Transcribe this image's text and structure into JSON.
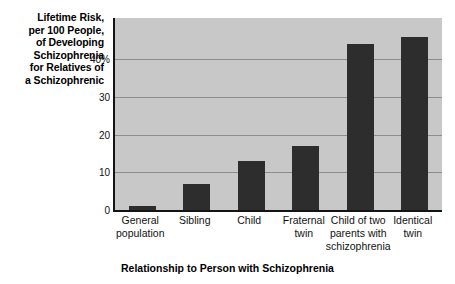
{
  "chart_data": {
    "type": "bar",
    "title": "",
    "ylabel": "Lifetime Risk, per 100 People, of Developing Schizophrenia for Relatives of a Schizophrenic",
    "xlabel": "Relationship to Person with Schizophrenia",
    "categories": [
      "General population",
      "Sibling",
      "Child",
      "Fraternal twin",
      "Child of two parents with schizophrenia",
      "Identical twin"
    ],
    "values": [
      1,
      7,
      13,
      17,
      44,
      46
    ],
    "ylim": [
      0,
      51
    ],
    "yticks": [
      0,
      10,
      20,
      30,
      40
    ],
    "ytick_labels": [
      "0",
      "10",
      "20",
      "30",
      "40%"
    ],
    "grid": true,
    "legend": "none",
    "bar_color": "#2d2d2d",
    "plot_background": "#c8c8c8",
    "gridline_color": "#8d8d8d",
    "axis_color": "#141414"
  },
  "y_axis_title_lines": [
    "Lifetime Risk,",
    "per 100 People,",
    "of Developing",
    "Schizophrenia",
    "for Relatives of",
    "a Schizophrenic"
  ],
  "x_axis_title": "Relationship to Person with Schizophrenia",
  "x_category_lines": [
    [
      "General",
      "population"
    ],
    [
      "Sibling"
    ],
    [
      "Child"
    ],
    [
      "Fraternal",
      "twin"
    ],
    [
      "Child of two",
      "parents with",
      "schizophrenia"
    ],
    [
      "Identical",
      "twin"
    ]
  ],
  "y_tick_labels": [
    "40%",
    "30",
    "20",
    "10",
    "0"
  ]
}
